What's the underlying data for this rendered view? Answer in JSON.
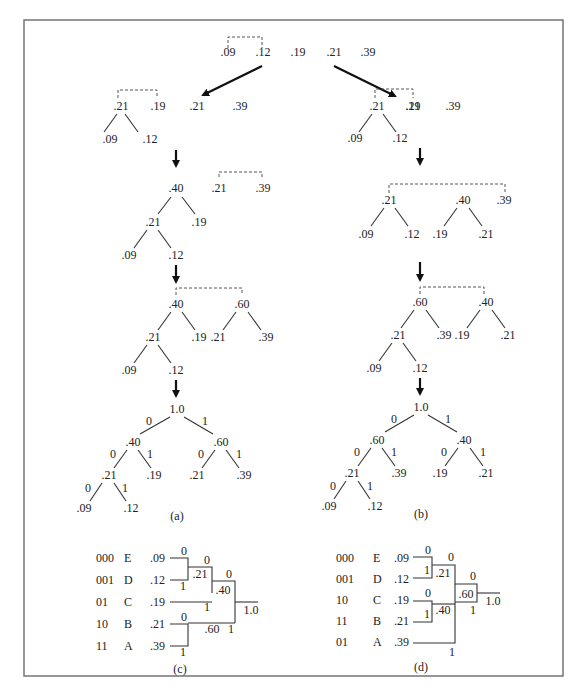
{
  "figure": {
    "top_row": [
      ".09",
      ".12",
      ".19",
      ".21",
      ".39"
    ],
    "panel_a": {
      "caption": "(a)",
      "step1": {
        "tree_root": ".21",
        "leaves": [
          ".09",
          ".12"
        ],
        "rest": [
          ".19",
          ".21",
          ".39"
        ]
      },
      "step2": {
        "tree_root": ".40",
        "mid": ".21",
        "mid_sibling": ".19",
        "leaves": [
          ".09",
          ".12"
        ],
        "rest": [
          ".21",
          ".39"
        ]
      },
      "step3": {
        "root_left": ".40",
        "root_right": ".60",
        "mid": ".21",
        "mid_sibling": ".19",
        "leaves": [
          ".09",
          ".12"
        ],
        "right_children": [
          ".21",
          ".39"
        ]
      },
      "final": {
        "root": "1.0",
        "left": ".40",
        "right": ".60",
        "mid": ".21",
        "mid_sibling": ".19",
        "leaves": [
          ".09",
          ".12"
        ],
        "right_children": [
          ".21",
          ".39"
        ],
        "bit0": "0",
        "bit1": "1"
      }
    },
    "panel_b": {
      "caption": "(b)",
      "step1": {
        "tree_root": ".21",
        "leaves": [
          ".09",
          ".12"
        ],
        "rest": [
          ".19",
          ".21",
          ".39"
        ]
      },
      "step2": {
        "tree_root": ".21",
        "leaves": [
          ".09",
          ".12"
        ],
        "second_root": ".40",
        "second_children": [
          ".19",
          ".21"
        ],
        "rest": ".39"
      },
      "step3": {
        "root_left": ".60",
        "root_right": ".40",
        "mid": ".21",
        "mid_sibling": ".39",
        "leaves": [
          ".09",
          ".12"
        ],
        "right_children": [
          ".19",
          ".21"
        ]
      },
      "final": {
        "root": "1.0",
        "left": ".60",
        "right": ".40",
        "mid": ".21",
        "mid_sibling": ".39",
        "leaves": [
          ".09",
          ".12"
        ],
        "right_children": [
          ".19",
          ".21"
        ],
        "bit0": "0",
        "bit1": "1"
      }
    },
    "panel_c": {
      "caption": "(c)",
      "rows": [
        {
          "code": "000",
          "symbol": "E",
          "prob": ".09"
        },
        {
          "code": "001",
          "symbol": "D",
          "prob": ".12"
        },
        {
          "code": "01",
          "symbol": "C",
          "prob": ".19"
        },
        {
          "code": "10",
          "symbol": "B",
          "prob": ".21"
        },
        {
          "code": "11",
          "symbol": "A",
          "prob": ".39"
        }
      ],
      "nodes": {
        "n1": ".21",
        "n2": ".40",
        "n3": ".60",
        "root": "1.0"
      }
    },
    "panel_d": {
      "caption": "(d)",
      "rows": [
        {
          "code": "000",
          "symbol": "E",
          "prob": ".09"
        },
        {
          "code": "001",
          "symbol": "D",
          "prob": ".12"
        },
        {
          "code": "10",
          "symbol": "C",
          "prob": ".19"
        },
        {
          "code": "11",
          "symbol": "B",
          "prob": ".21"
        },
        {
          "code": "01",
          "symbol": "A",
          "prob": ".39"
        }
      ],
      "nodes": {
        "n1": ".21",
        "n2": ".40",
        "n3": ".60",
        "root": "1.0"
      }
    }
  }
}
